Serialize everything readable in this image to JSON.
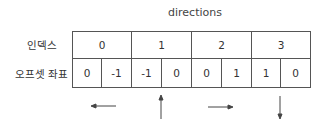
{
  "title": "directions",
  "labels": {
    "index": "인덱스",
    "offset": "오프셋 좌표"
  },
  "indices": [
    "0",
    "1",
    "2",
    "3"
  ],
  "offsets": [
    "0",
    "-1",
    "-1",
    "0",
    "0",
    "1",
    "1",
    "0"
  ],
  "arrows": [
    "left",
    "up",
    "right",
    "down"
  ]
}
